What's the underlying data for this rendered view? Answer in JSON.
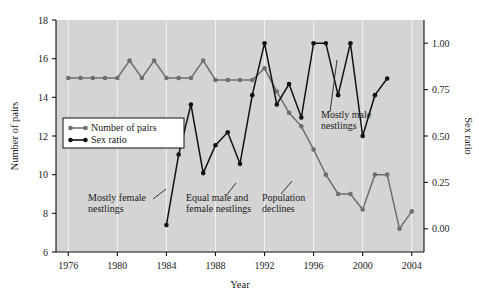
{
  "chart_data": {
    "type": "line",
    "title": "",
    "xlabel": "Year",
    "ylabel": "Number of pairs",
    "y2label": "Sex ratio",
    "xlim": [
      1975,
      2005
    ],
    "ylim": [
      6,
      18
    ],
    "y2lim": [
      -0.125,
      1.125
    ],
    "grid": true,
    "legend_position": "upper-left-inside",
    "xticks": [
      1976,
      1980,
      1984,
      1988,
      1992,
      1996,
      2000,
      2004
    ],
    "xtick_labels": [
      "1976",
      "1980",
      "1984",
      "1988",
      "1992",
      "1996",
      "2000",
      "2004"
    ],
    "yticks": [
      6,
      8,
      10,
      12,
      14,
      16,
      18
    ],
    "ytick_labels": [
      "6",
      "8",
      "10",
      "12",
      "14",
      "16",
      "18"
    ],
    "y2ticks": [
      0.0,
      0.25,
      0.5,
      0.75,
      1.0
    ],
    "y2tick_labels": [
      "0.00",
      "0.25",
      "0.50",
      "0.75",
      "1.00"
    ],
    "x": [
      1976,
      1977,
      1978,
      1979,
      1980,
      1981,
      1982,
      1983,
      1984,
      1985,
      1986,
      1987,
      1988,
      1989,
      1990,
      1991,
      1992,
      1993,
      1994,
      1995,
      1996,
      1997,
      1998,
      1999,
      2000,
      2001,
      2002,
      2003,
      2004
    ],
    "series": [
      {
        "name": "Number of pairs",
        "color": "#6e6e6e",
        "axis": "left",
        "values": [
          15,
          15,
          15,
          15,
          15,
          15.9,
          15,
          15.9,
          15,
          15,
          15,
          15.9,
          14.9,
          14.9,
          14.9,
          14.9,
          15.5,
          14.3,
          13.2,
          12.5,
          11.3,
          10.0,
          9.0,
          9.0,
          8.2,
          10.0,
          10.0,
          7.2,
          8.1
        ]
      },
      {
        "name": "Sex ratio",
        "color": "#111111",
        "axis": "right",
        "values": [
          null,
          null,
          null,
          null,
          null,
          null,
          null,
          null,
          0.02,
          0.4,
          0.67,
          0.3,
          0.45,
          0.52,
          0.35,
          0.72,
          1.0,
          0.67,
          0.78,
          0.6,
          1.0,
          1.0,
          0.72,
          1.0,
          0.5,
          0.72,
          0.81,
          null,
          null
        ]
      }
    ],
    "annotations": [
      {
        "text_line1": "Mostly female",
        "text_line2": "nestlings",
        "anchor_year": 1984
      },
      {
        "text_line1": "Equal male and",
        "text_line2": "female nestlings",
        "anchor_year": 1989
      },
      {
        "text_line1": "Population",
        "text_line2": "declines",
        "anchor_year": 1994
      },
      {
        "text_line1": "Mostly male",
        "text_line2": "nestlings",
        "anchor_year": 1996
      }
    ],
    "legend": [
      {
        "label": "Number of pairs",
        "color": "#6e6e6e"
      },
      {
        "label": "Sex ratio",
        "color": "#111111"
      }
    ],
    "colors": {
      "plot_background": "#d4d4d4",
      "grid": "#f2f2f2",
      "axis": "#111111",
      "page_background": "#ffffff"
    }
  }
}
